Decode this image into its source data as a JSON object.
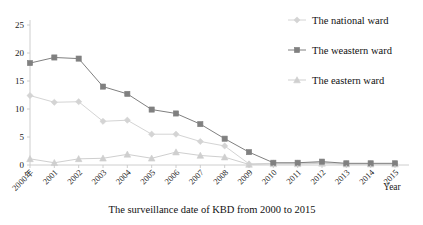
{
  "chart_data": {
    "type": "line",
    "title": "",
    "caption": "The surveillance date of KBD from 2000 to 2015",
    "xlabel": "Year",
    "ylabel": "",
    "grid": false,
    "legend_position": "right",
    "ylim": [
      0,
      25
    ],
    "yticks": [
      0,
      5,
      10,
      15,
      20,
      25
    ],
    "categories": [
      "2000年",
      "2001",
      "2002",
      "2003",
      "2004",
      "2005",
      "2006",
      "2007",
      "2008",
      "2009",
      "2010",
      "2011",
      "2012",
      "2013",
      "2014",
      "2015"
    ],
    "series": [
      {
        "name": "The national ward",
        "marker": "diamond",
        "color": "#d4d4d4",
        "values": [
          12.4,
          11.2,
          11.3,
          7.8,
          8.0,
          5.5,
          5.5,
          4.2,
          3.4,
          0.2,
          0.3,
          0.3,
          0.5,
          0.2,
          0.2,
          0.2
        ]
      },
      {
        "name": "The weastern ward",
        "marker": "square",
        "color": "#808080",
        "values": [
          18.2,
          19.2,
          19.0,
          14.0,
          12.7,
          9.9,
          9.2,
          7.3,
          4.7,
          2.3,
          0.4,
          0.4,
          0.6,
          0.3,
          0.3,
          0.3
        ]
      },
      {
        "name": "The eastern ward",
        "marker": "triangle",
        "color": "#cfcfcf",
        "values": [
          1.1,
          0.4,
          1.1,
          1.2,
          1.9,
          1.2,
          2.3,
          1.7,
          1.4,
          0.1,
          0.2,
          0.2,
          0.3,
          0.15,
          0.15,
          0.15
        ]
      }
    ]
  },
  "legend": {
    "items": [
      {
        "label": "The national ward"
      },
      {
        "label": "The weastern ward"
      },
      {
        "label": "The eastern ward"
      }
    ]
  },
  "axes": {
    "x_title": "Year",
    "y_ticks": [
      "0",
      "5",
      "10",
      "15",
      "20",
      "25"
    ]
  },
  "caption": {
    "text": "The surveillance date of KBD from 2000 to 2015"
  },
  "colors": {
    "national": "#d4d4d4",
    "weastern": "#808080",
    "eastern": "#cfcfcf",
    "axis": "#c8c8c8",
    "text": "#111111"
  }
}
